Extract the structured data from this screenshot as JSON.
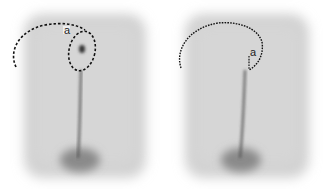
{
  "figure": {
    "panels": [
      {
        "id": "left",
        "label": "a",
        "description": "Sacrococcygeal region with circular flap outline around midline lesion and dashed arc extending to the left"
      },
      {
        "id": "right",
        "label": "a",
        "description": "Same region showing curved dashed incision line arcing from left over to midline point"
      }
    ]
  }
}
